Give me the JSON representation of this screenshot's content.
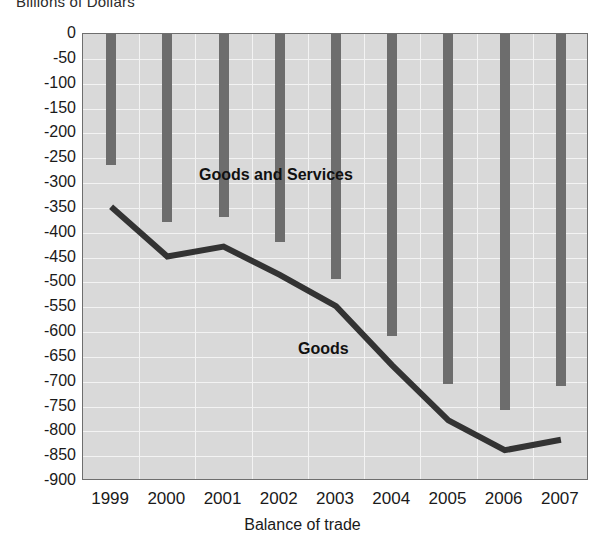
{
  "chart_data": {
    "type": "bar",
    "title": "",
    "ylabel": "Billions of Dollars",
    "xlabel": "Balance of trade",
    "categories": [
      "1999",
      "2000",
      "2001",
      "2002",
      "2003",
      "2004",
      "2005",
      "2006",
      "2007"
    ],
    "ylim": [
      -900,
      0
    ],
    "ytick_step": 50,
    "yticks": [
      "0",
      "-50",
      "-100",
      "-150",
      "-200",
      "-250",
      "-300",
      "-350",
      "-400",
      "-450",
      "-500",
      "-550",
      "-600",
      "-650",
      "-700",
      "-750",
      "-800",
      "-850",
      "-900"
    ],
    "ytick_values": [
      0,
      -50,
      -100,
      -150,
      -200,
      -250,
      -300,
      -350,
      -400,
      -450,
      -500,
      -550,
      -600,
      -650,
      -700,
      -750,
      -800,
      -850,
      -900
    ],
    "grid": true,
    "legend_position": "inline-annotation",
    "series": [
      {
        "name": "Goods and Services",
        "type": "bar",
        "color": "#6d6d6d",
        "values": [
          -263,
          -378,
          -368,
          -418,
          -494,
          -608,
          -705,
          -758,
          -708
        ],
        "annotation": "Goods and Services"
      },
      {
        "name": "Goods",
        "type": "line",
        "color": "#333333",
        "values": [
          -348,
          -448,
          -428,
          -485,
          -548,
          -667,
          -778,
          -838,
          -817
        ],
        "annotation": "Goods"
      }
    ],
    "plot_background": "#d9d9d9",
    "gridline_color": "#f3f3f3"
  },
  "labels": {
    "top_axis_title": "Billions of Dollars",
    "bottom_axis_title": "Balance of trade",
    "series_goods_services": "Goods and Services",
    "series_goods": "Goods"
  }
}
